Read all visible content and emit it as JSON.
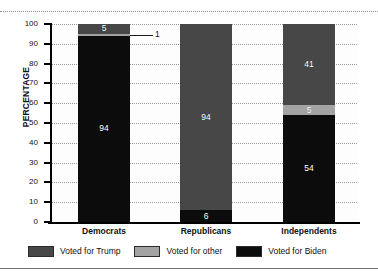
{
  "chart_data": {
    "type": "bar",
    "subtype": "stacked-column-100",
    "title": "",
    "xlabel": "",
    "ylabel": "PERCENTAGE",
    "ylim": [
      0,
      100
    ],
    "ytick_step": 10,
    "yticks": [
      "100",
      "90",
      "80",
      "70",
      "60",
      "50",
      "40",
      "30",
      "20",
      "10",
      "0"
    ],
    "grid": "horizontal-dotted",
    "legend_position": "bottom",
    "categories": [
      "Democrats",
      "Republicans",
      "Independents"
    ],
    "series": [
      {
        "name": "Voted for Trump",
        "color": "#474747",
        "values": [
          5,
          94,
          41
        ],
        "labels": [
          "5",
          "94",
          "41"
        ]
      },
      {
        "name": "Voted for other",
        "color": "#a3a3a3",
        "values": [
          1,
          0,
          5
        ],
        "labels": [
          "1",
          "",
          "5"
        ]
      },
      {
        "name": "Voted for Biden",
        "color": "#0c0c0c",
        "values": [
          94,
          6,
          54
        ],
        "labels": [
          "94",
          "6",
          "54"
        ]
      }
    ],
    "annotations": [
      {
        "text": "1",
        "points_to": "Democrats / Voted for other",
        "style": "leader-line"
      }
    ]
  },
  "legend": {
    "items": [
      {
        "label": "Voted for Trump",
        "color": "#474747"
      },
      {
        "label": "Voted for other",
        "color": "#a3a3a3"
      },
      {
        "label": "Voted for Biden",
        "color": "#0c0c0c"
      }
    ]
  }
}
